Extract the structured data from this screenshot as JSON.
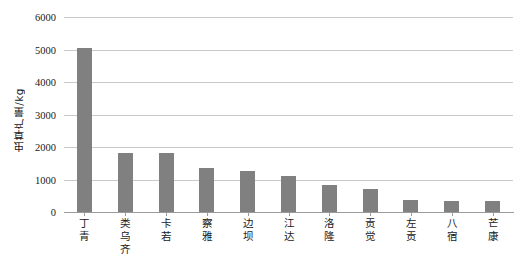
{
  "chart_data": {
    "type": "bar",
    "title": "",
    "subtitle": "",
    "xlabel": "",
    "ylabel": "虫草产量/kg",
    "categories": [
      "丁青",
      "类乌齐",
      "卡若",
      "察雅",
      "边坝",
      "江达",
      "洛隆",
      "贡觉",
      "左贡",
      "八宿",
      "芒康"
    ],
    "values": [
      5050,
      1820,
      1810,
      1350,
      1250,
      1120,
      820,
      700,
      380,
      350,
      330
    ],
    "ylim": [
      0,
      6000
    ],
    "ytick_values": [
      0,
      1000,
      2000,
      3000,
      4000,
      5000,
      6000
    ],
    "ytick_labels": [
      "0",
      "1000",
      "2000",
      "3000",
      "4000",
      "5000",
      "6000"
    ],
    "grid": "horizontal",
    "legend": "none",
    "bar_color": "#808080",
    "gridline_color": "#c9c9c9",
    "axis_color": "#9a9a9a",
    "background_color": "#ffffff"
  }
}
